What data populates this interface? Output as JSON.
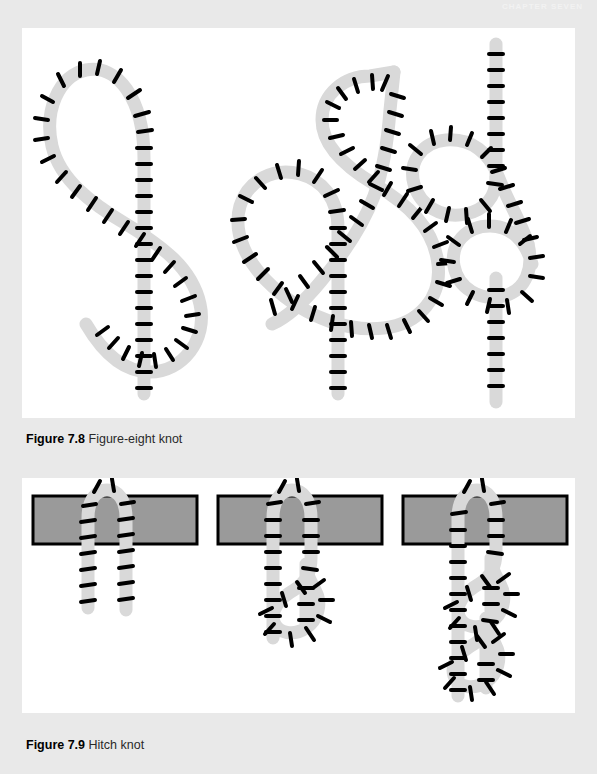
{
  "page": {
    "running_head": "CHAPTER SEVEN",
    "background_color": "#e9e9e9",
    "panel_color": "#ffffff"
  },
  "figures": [
    {
      "id": "figure-7-8",
      "label": "Figure 7.8",
      "title": "Figure-eight knot",
      "panel": {
        "x": 22,
        "y": 28,
        "width": 553,
        "height": 390
      },
      "caption_y": 432,
      "steps": [
        {
          "index": 1,
          "name": "loop-crossed",
          "description": "Rope formed into an open loop with the working end crossed over the standing part"
        },
        {
          "index": 2,
          "name": "end-passed-through",
          "description": "Working end brought around the standing part and passed down through the loop"
        },
        {
          "index": 3,
          "name": "tightened",
          "description": "Knot drawn tight forming the finished figure-eight stopper knot"
        }
      ]
    },
    {
      "id": "figure-7-9",
      "label": "Figure 7.9",
      "title": "Hitch knot",
      "panel": {
        "x": 22,
        "y": 478,
        "width": 553,
        "height": 235
      },
      "caption_y": 738,
      "bars": [
        {
          "x": 33,
          "y": 496,
          "width": 164,
          "height": 48
        },
        {
          "x": 218,
          "y": 496,
          "width": 164,
          "height": 48
        },
        {
          "x": 403,
          "y": 496,
          "width": 164,
          "height": 48
        }
      ],
      "steps": [
        {
          "index": 1,
          "name": "rope-over-rail",
          "description": "Rope laid over the rail with both ends hanging free"
        },
        {
          "index": 2,
          "name": "first-half-hitch",
          "description": "Working end wrapped around the standing part forming one half hitch"
        },
        {
          "index": 3,
          "name": "two-half-hitches",
          "description": "A second half hitch added below the first, completing the hitch knot"
        }
      ]
    }
  ],
  "colors": {
    "rope_fill": "#d9d9d9",
    "rope_outline": "#000000",
    "bar_fill": "#9a9a9a",
    "bar_outline": "#000000",
    "page_background": "#e9e9e9",
    "panel_background": "#ffffff"
  }
}
